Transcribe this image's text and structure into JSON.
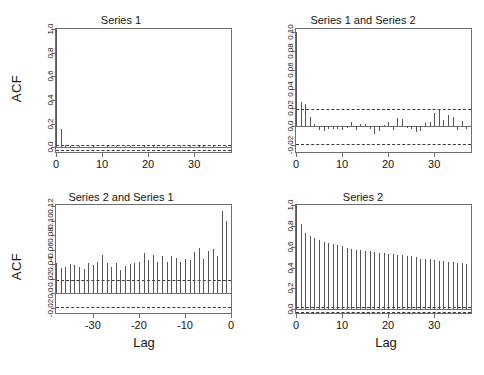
{
  "figure": {
    "background": "#ffffff",
    "axis_color": "#6e6e6e",
    "bar_color": "#555555",
    "conf_color": "#3a3a3a",
    "acf_axis_label": "ACF",
    "lag_axis_label": "Lag"
  },
  "chart_data": [
    {
      "id": "series1-acf",
      "type": "bar",
      "title": "Series 1",
      "xlabel": "",
      "ylabel": "ACF",
      "grid": false,
      "legend": null,
      "xlim": [
        0,
        38
      ],
      "ylim": [
        -0.04,
        1.0
      ],
      "xticks": [
        0,
        10,
        20,
        30
      ],
      "yticks": [
        0.0,
        0.2,
        0.4,
        0.6,
        0.8,
        1.0
      ],
      "ytick_labels": [
        "0.0",
        "0.2",
        "0.4",
        "0.6",
        "0.8",
        "1.0"
      ],
      "conf_bands": [
        0.021,
        -0.021
      ],
      "x": [
        0,
        1,
        2,
        3,
        4,
        5,
        6,
        7,
        8,
        9,
        10,
        11,
        12,
        13,
        14,
        15,
        16,
        17,
        18,
        19,
        20,
        21,
        22,
        23,
        24,
        25,
        26,
        27,
        28,
        29,
        30,
        31,
        32,
        33,
        34,
        35,
        36,
        37,
        38
      ],
      "values": [
        1.0,
        0.155,
        0.02,
        0.008,
        0.005,
        0.012,
        -0.004,
        0.006,
        0.01,
        0.003,
        -0.006,
        0.008,
        0.004,
        0.012,
        -0.003,
        0.007,
        0.014,
        0.005,
        0.002,
        0.009,
        -0.005,
        0.011,
        0.006,
        0.003,
        0.013,
        0.004,
        -0.002,
        0.008,
        0.005,
        0.01,
        0.003,
        0.012,
        0.007,
        0.004,
        0.009,
        0.002,
        0.006,
        0.011,
        0.005
      ]
    },
    {
      "id": "series1-series2-ccf",
      "type": "bar",
      "title": "Series 1 and Series 2",
      "xlabel": "",
      "ylabel": "",
      "grid": false,
      "legend": null,
      "xlim": [
        0,
        38
      ],
      "ylim": [
        -0.027,
        0.103
      ],
      "xticks": [
        0,
        10,
        20,
        30
      ],
      "yticks": [
        -0.02,
        0.0,
        0.02,
        0.04,
        0.06,
        0.08,
        0.1
      ],
      "ytick_labels": [
        "-0.02",
        "0.0",
        "0.02",
        "0.04",
        "0.06",
        "0.08",
        "0.10"
      ],
      "conf_bands": [
        0.0185,
        -0.0185
      ],
      "x": [
        0,
        1,
        2,
        3,
        4,
        5,
        6,
        7,
        8,
        9,
        10,
        11,
        12,
        13,
        14,
        15,
        16,
        17,
        18,
        19,
        20,
        21,
        22,
        23,
        24,
        25,
        26,
        27,
        28,
        29,
        30,
        31,
        32,
        33,
        34,
        35,
        36,
        37,
        38
      ],
      "values": [
        0.0995,
        0.0255,
        0.0235,
        0.0095,
        0.0022,
        -0.0035,
        -0.0048,
        -0.0028,
        -0.0032,
        -0.003,
        -0.0042,
        -0.0015,
        0.0052,
        -0.0042,
        0.0028,
        0.0022,
        -0.0028,
        -0.0082,
        -0.0045,
        0.0018,
        0.0042,
        -0.0035,
        0.009,
        0.0078,
        -0.0018,
        -0.0022,
        -0.0055,
        -0.0048,
        0.0032,
        0.0042,
        0.0145,
        0.0188,
        0.0068,
        0.0118,
        0.0098,
        -0.0042,
        0.0062,
        -0.0032,
        -0.0008
      ]
    },
    {
      "id": "series2-series1-ccf",
      "type": "bar",
      "title": "Series 2 and Series 1",
      "xlabel": "Lag",
      "ylabel": "ACF",
      "grid": false,
      "legend": null,
      "xlim": [
        -38,
        0
      ],
      "ylim": [
        -0.027,
        0.122
      ],
      "xticks": [
        -30,
        -20,
        -10,
        0
      ],
      "yticks": [
        -0.02,
        0.0,
        0.02,
        0.04,
        0.06,
        0.08,
        0.1,
        0.12
      ],
      "ytick_labels": [
        "-0.02",
        "0.0",
        "0.02",
        "0.04",
        "0.06",
        "0.08",
        "0.10",
        "0.12"
      ],
      "conf_bands": [
        0.0188,
        -0.0188
      ],
      "x": [
        -38,
        -37,
        -36,
        -35,
        -34,
        -33,
        -32,
        -31,
        -30,
        -29,
        -28,
        -27,
        -26,
        -25,
        -24,
        -23,
        -22,
        -21,
        -20,
        -19,
        -18,
        -17,
        -16,
        -15,
        -14,
        -13,
        -12,
        -11,
        -10,
        -9,
        -8,
        -7,
        -6,
        -5,
        -4,
        -3,
        -2,
        -1,
        0
      ],
      "values": [
        0.0425,
        0.0345,
        0.0358,
        0.0402,
        0.0388,
        0.0362,
        0.0335,
        0.0425,
        0.0392,
        0.0435,
        0.0525,
        0.0425,
        0.0358,
        0.0415,
        0.0322,
        0.0378,
        0.0412,
        0.0425,
        0.0428,
        0.0562,
        0.0462,
        0.0525,
        0.0432,
        0.0512,
        0.0428,
        0.0518,
        0.0488,
        0.0438,
        0.0472,
        0.0468,
        0.0572,
        0.0625,
        0.0478,
        0.0592,
        0.0618,
        0.0518,
        0.1142,
        0.1002,
        0.0122
      ]
    },
    {
      "id": "series2-acf",
      "type": "bar",
      "title": "Series 2",
      "xlabel": "Lag",
      "ylabel": "",
      "grid": false,
      "legend": null,
      "xlim": [
        0,
        38
      ],
      "ylim": [
        -0.035,
        1.0
      ],
      "xticks": [
        0,
        10,
        20,
        30
      ],
      "yticks": [
        0.0,
        0.2,
        0.4,
        0.6,
        0.8,
        1.0
      ],
      "ytick_labels": [
        "0.0",
        "0.2",
        "0.4",
        "0.6",
        "0.8",
        "1.0"
      ],
      "conf_bands": [
        0.022,
        -0.022
      ],
      "x": [
        0,
        1,
        2,
        3,
        4,
        5,
        6,
        7,
        8,
        9,
        10,
        11,
        12,
        13,
        14,
        15,
        16,
        17,
        18,
        19,
        20,
        21,
        22,
        23,
        24,
        25,
        26,
        27,
        28,
        29,
        30,
        31,
        32,
        33,
        34,
        35,
        36,
        37,
        38
      ],
      "values": [
        1.0,
        0.818,
        0.728,
        0.702,
        0.688,
        0.668,
        0.648,
        0.638,
        0.622,
        0.612,
        0.605,
        0.592,
        0.578,
        0.568,
        0.568,
        0.562,
        0.555,
        0.548,
        0.542,
        0.538,
        0.532,
        0.528,
        0.522,
        0.518,
        0.512,
        0.508,
        0.498,
        0.482,
        0.478,
        0.478,
        0.475,
        0.468,
        0.462,
        0.458,
        0.452,
        0.448,
        0.442,
        0.438,
        0.432
      ]
    }
  ]
}
